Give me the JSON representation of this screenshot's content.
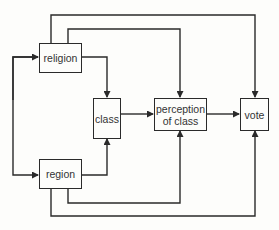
{
  "diagram": {
    "nodes": [
      {
        "id": "religion",
        "label": "religion"
      },
      {
        "id": "region",
        "label": "region"
      },
      {
        "id": "class",
        "label": "class"
      },
      {
        "id": "perception",
        "label": "perception of class",
        "line1": "perception",
        "line2": "of class"
      },
      {
        "id": "vote",
        "label": "vote"
      }
    ],
    "edges": [
      {
        "from": "religion",
        "to": "region",
        "bidirectional": true
      },
      {
        "from": "religion",
        "to": "class"
      },
      {
        "from": "region",
        "to": "class"
      },
      {
        "from": "religion",
        "to": "perception"
      },
      {
        "from": "region",
        "to": "perception"
      },
      {
        "from": "religion",
        "to": "vote"
      },
      {
        "from": "region",
        "to": "vote"
      },
      {
        "from": "class",
        "to": "perception"
      },
      {
        "from": "perception",
        "to": "vote"
      }
    ],
    "colors": {
      "line": "#2a2a2a",
      "background": "#fdfdfb",
      "text": "#333333"
    }
  }
}
